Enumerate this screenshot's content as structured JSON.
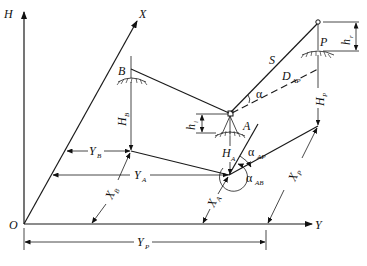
{
  "diagram": {
    "type": "survey-geometry",
    "axes": {
      "vertical": "H",
      "x_axis": "X",
      "y_axis": "Y",
      "origin": "O"
    },
    "points": [
      {
        "id": "A",
        "label": "A",
        "role": "instrument-station"
      },
      {
        "id": "B",
        "label": "B",
        "role": "backsight-point"
      },
      {
        "id": "P",
        "label": "P",
        "role": "target-point"
      }
    ],
    "labels": {
      "slope_distance": "S",
      "horizontal_distance": "D",
      "horizontal_distance_sub": "AP",
      "vertical_angle": "α",
      "instrument_height": "h",
      "instrument_height_sub": "i",
      "target_height": "h",
      "target_height_sub": "r",
      "elevation_A": "H",
      "elevation_A_sub": "A",
      "elevation_B": "H",
      "elevation_B_sub": "B",
      "elevation_P": "H",
      "elevation_P_sub": "P",
      "azimuth_AP": "α",
      "azimuth_AP_sub": "AP",
      "azimuth_AB": "α",
      "azimuth_AB_sub": "AB",
      "coord_YB": "Y",
      "coord_YB_sub": "B",
      "coord_YA": "Y",
      "coord_YA_sub": "A",
      "coord_YP": "Y",
      "coord_YP_sub": "P",
      "coord_XB": "X",
      "coord_XB_sub": "B",
      "coord_XA": "X",
      "coord_XA_sub": "A",
      "coord_XP": "X",
      "coord_XP_sub": "P"
    }
  }
}
